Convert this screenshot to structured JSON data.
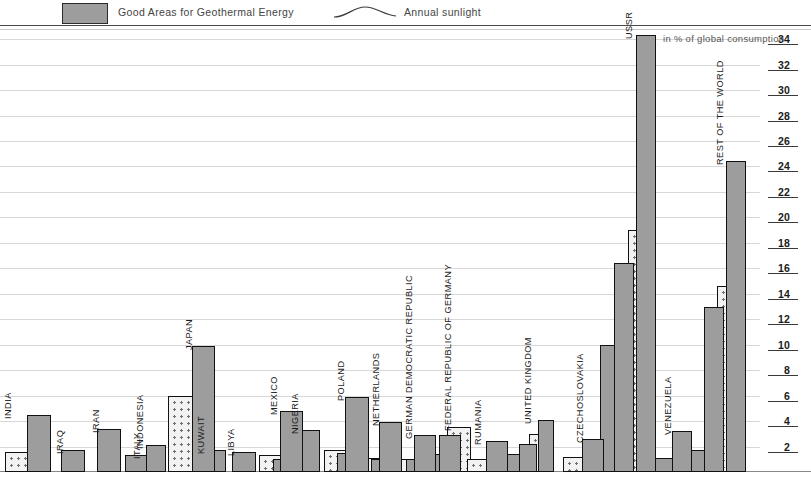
{
  "legend": {
    "geothermal_label": "Good Areas for Geothermal Energy",
    "sunlight_label": "Annual sunlight",
    "swatch_icon": "filled-rectangle-swatch",
    "sun_icon": "annual-sunlight-curve-icon"
  },
  "axis": {
    "note": "in % of global consumption",
    "ticks": [
      34,
      32,
      30,
      28,
      26,
      24,
      22,
      20,
      18,
      16,
      14,
      12,
      10,
      8,
      6,
      4,
      2
    ],
    "min": 0,
    "max": 35.4
  },
  "colors": {
    "solid_bar": "#9d9d9d",
    "dotted_bar": "#f2f2f2",
    "dot": "#6f6f6f",
    "outline": "#111111",
    "gridline": "#d7d7d7",
    "tick_rule": "#3a3a3a"
  },
  "chart_data": {
    "type": "bar",
    "title": "",
    "subtitle": "",
    "xlabel": "",
    "ylabel": "in % of global consumption",
    "ylim": [
      0,
      35.4
    ],
    "grid": true,
    "legend_position": "top",
    "orientation": "vertical",
    "categories": [
      "INDIA",
      "IRAQ",
      "IRAN",
      "INDONESIA",
      "ITALY",
      "JAPAN",
      "KUWAIT",
      "LIBYA",
      "MEXICO",
      "NIGERIA",
      "POLAND",
      "NETHERLANDS",
      "GERMAN DEMOCRATIC REPUBLIC",
      "FEDERAL REPUBLIC OF GERMANY",
      "RUMANIA",
      "UNITED KINGDOM",
      "CZECHOSLOVAKIA",
      "USSR",
      "VENEZUELA",
      "REST OF THE WORLD"
    ],
    "series": [
      {
        "name": "Good Areas for Geothermal Energy",
        "style": "dotted",
        "values": [
          1.6,
          null,
          null,
          null,
          1.3,
          6.0,
          null,
          null,
          1.3,
          null,
          1.7,
          1.1,
          1.0,
          3.5,
          1.0,
          3.0,
          1.2,
          19.0,
          null,
          14.6
        ]
      },
      {
        "name": "bar-2",
        "style": "solid",
        "values": [
          4.5,
          1.7,
          3.4,
          1.3,
          null,
          9.9,
          1.7,
          1.6,
          1.0,
          3.3,
          1.5,
          1.0,
          1.0,
          1.4,
          1.0,
          1.4,
          1.0,
          10.0,
          1.1,
          1.7
        ]
      },
      {
        "name": "bar-3",
        "style": "solid",
        "values": [
          null,
          null,
          null,
          2.1,
          null,
          null,
          null,
          null,
          4.8,
          null,
          5.9,
          3.9,
          2.9,
          2.9,
          2.4,
          2.2,
          2.6,
          16.4,
          3.2,
          13.0
        ]
      },
      {
        "name": "bar-4",
        "style": "solid",
        "values": [
          null,
          null,
          null,
          null,
          null,
          null,
          null,
          null,
          null,
          null,
          null,
          null,
          null,
          null,
          null,
          4.1,
          null,
          34.3,
          null,
          24.4
        ]
      }
    ],
    "group_bar_counts": [
      2,
      1,
      1,
      2,
      1,
      2,
      1,
      1,
      3,
      1,
      3,
      3,
      3,
      3,
      3,
      4,
      3,
      4,
      2,
      4
    ]
  },
  "groups": [
    {
      "label": "INDIA",
      "x": 5,
      "width": 48,
      "label_offset": 8,
      "bars": [
        {
          "style": "dotted",
          "value": 1.6,
          "w": 24,
          "dx": 0
        },
        {
          "style": "solid",
          "value": 4.5,
          "w": 24,
          "dx": 22
        }
      ]
    },
    {
      "label": "IRAQ",
      "x": 61,
      "width": 26,
      "label_offset": 4,
      "bars": [
        {
          "style": "solid",
          "value": 1.7,
          "w": 24,
          "dx": 0
        }
      ]
    },
    {
      "label": "IRAN",
      "x": 97,
      "width": 26,
      "label_offset": 4,
      "bars": [
        {
          "style": "solid",
          "value": 3.4,
          "w": 24,
          "dx": 0
        }
      ]
    },
    {
      "label": "INDONESIA",
      "x": 125,
      "width": 45,
      "label_offset": 20,
      "bars": [
        {
          "style": "solid",
          "value": 1.3,
          "w": 24,
          "dx": 0
        },
        {
          "style": "solid",
          "value": 2.1,
          "w": 20,
          "dx": 21
        }
      ]
    },
    {
      "label": "ITALY",
      "x": 138,
      "width": 28,
      "label_offset": 4,
      "bars": [
        {
          "style": "dotted",
          "value": 1.3,
          "w": 25,
          "dx": 0
        }
      ]
    },
    {
      "label": "JAPAN",
      "x": 168,
      "width": 48,
      "label_offset": 26,
      "bars": [
        {
          "style": "dotted",
          "value": 6.0,
          "w": 25,
          "dx": 0
        },
        {
          "style": "solid",
          "value": 9.9,
          "w": 23,
          "dx": 24
        }
      ]
    },
    {
      "label": "KUWAIT",
      "x": 202,
      "width": 26,
      "label_offset": 4,
      "bars": [
        {
          "style": "solid",
          "value": 1.7,
          "w": 24,
          "dx": 0
        }
      ]
    },
    {
      "label": "LIBYA",
      "x": 232,
      "width": 26,
      "label_offset": 4,
      "bars": [
        {
          "style": "solid",
          "value": 1.6,
          "w": 24,
          "dx": 0
        }
      ]
    },
    {
      "label": "MEXICO",
      "x": 259,
      "width": 45,
      "label_offset": 20,
      "bars": [
        {
          "style": "dotted",
          "value": 1.3,
          "w": 23,
          "dx": 0
        },
        {
          "style": "solid",
          "value": 1.0,
          "w": 14,
          "dx": 14
        },
        {
          "style": "solid",
          "value": 4.8,
          "w": 23,
          "dx": 21
        }
      ]
    },
    {
      "label": "NIGERIA",
      "x": 296,
      "width": 26,
      "label_offset": 4,
      "bars": [
        {
          "style": "solid",
          "value": 3.3,
          "w": 24,
          "dx": 0
        }
      ]
    },
    {
      "label": "POLAND",
      "x": 324,
      "width": 45,
      "label_offset": 22,
      "bars": [
        {
          "style": "dotted",
          "value": 1.7,
          "w": 24,
          "dx": 0
        },
        {
          "style": "solid",
          "value": 1.5,
          "w": 13,
          "dx": 13
        },
        {
          "style": "solid",
          "value": 5.9,
          "w": 24,
          "dx": 21
        }
      ]
    },
    {
      "label": "NETHERLANDS",
      "x": 359,
      "width": 45,
      "label_offset": 22,
      "bars": [
        {
          "style": "dotted",
          "value": 1.1,
          "w": 24,
          "dx": 0
        },
        {
          "style": "solid",
          "value": 1.0,
          "w": 12,
          "dx": 12
        },
        {
          "style": "solid",
          "value": 3.9,
          "w": 23,
          "dx": 20
        }
      ]
    },
    {
      "label": "GERMAN DEMOCRATIC REPUBLIC",
      "x": 394,
      "width": 45,
      "label_offset": 20,
      "bars": [
        {
          "style": "dotted",
          "value": 1.0,
          "w": 23,
          "dx": 0
        },
        {
          "style": "solid",
          "value": 1.0,
          "w": 12,
          "dx": 12
        },
        {
          "style": "solid",
          "value": 2.9,
          "w": 22,
          "dx": 20
        }
      ]
    },
    {
      "label": "FEDERAL REPUBLIC OF GERMANY",
      "x": 429,
      "width": 48,
      "label_offset": 24,
      "bars": [
        {
          "style": "dotted",
          "value": 3.5,
          "w": 24,
          "dx": 18
        },
        {
          "style": "solid",
          "value": 1.4,
          "w": 22,
          "dx": 0
        },
        {
          "style": "solid",
          "value": 2.9,
          "w": 22,
          "dx": 10
        }
      ]
    },
    {
      "label": "RUMANIA",
      "x": 467,
      "width": 45,
      "label_offset": 16,
      "bars": [
        {
          "style": "dotted",
          "value": 1.0,
          "w": 23,
          "dx": 0
        },
        {
          "style": "solid",
          "value": 2.4,
          "w": 22,
          "dx": 19
        }
      ]
    },
    {
      "label": "UNITED KINGDOM",
      "x": 507,
      "width": 52,
      "label_offset": 26,
      "bars": [
        {
          "style": "solid",
          "value": 1.4,
          "w": 20,
          "dx": 0
        },
        {
          "style": "solid",
          "value": 2.2,
          "w": 18,
          "dx": 12
        },
        {
          "style": "dotted",
          "value": 3.0,
          "w": 17,
          "dx": 22
        },
        {
          "style": "solid",
          "value": 4.1,
          "w": 16,
          "dx": 31
        }
      ]
    },
    {
      "label": "CZECHOSLOVAKIA",
      "x": 563,
      "width": 45,
      "label_offset": 22,
      "bars": [
        {
          "style": "dotted",
          "value": 1.2,
          "w": 23,
          "dx": 0
        },
        {
          "style": "solid",
          "value": 2.6,
          "w": 22,
          "dx": 19
        }
      ]
    },
    {
      "label": "USSR",
      "x": 600,
      "width": 60,
      "label_offset": 34,
      "bars": [
        {
          "style": "solid",
          "value": 10.0,
          "w": 22,
          "dx": 0
        },
        {
          "style": "solid",
          "value": 16.4,
          "w": 20,
          "dx": 14
        },
        {
          "style": "dotted",
          "value": 19.0,
          "w": 17,
          "dx": 28
        },
        {
          "style": "solid",
          "value": 34.3,
          "w": 20,
          "dx": 36
        }
      ]
    },
    {
      "label": "VENEZUELA",
      "x": 655,
      "width": 45,
      "label_offset": 18,
      "bars": [
        {
          "style": "solid",
          "value": 1.1,
          "w": 22,
          "dx": 0
        },
        {
          "style": "solid",
          "value": 3.2,
          "w": 20,
          "dx": 17
        }
      ]
    },
    {
      "label": "REST OF THE WORLD",
      "x": 691,
      "width": 62,
      "label_offset": 34,
      "bars": [
        {
          "style": "solid",
          "value": 1.7,
          "w": 22,
          "dx": 0
        },
        {
          "style": "solid",
          "value": 13.0,
          "w": 20,
          "dx": 13
        },
        {
          "style": "dotted",
          "value": 14.6,
          "w": 16,
          "dx": 26
        },
        {
          "style": "solid",
          "value": 24.4,
          "w": 20,
          "dx": 35
        }
      ]
    }
  ]
}
